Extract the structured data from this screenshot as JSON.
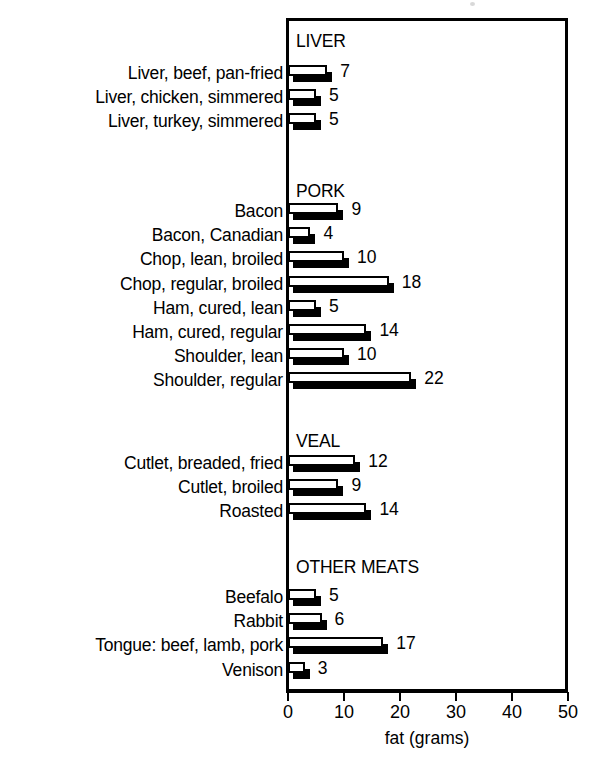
{
  "chart_data": {
    "type": "bar",
    "orientation": "horizontal",
    "title": "",
    "xlabel": "fat (grams)",
    "ylabel": "",
    "xlim": [
      0,
      50
    ],
    "xticks": [
      0,
      10,
      20,
      30,
      40,
      50
    ],
    "grid": false,
    "legend": "none",
    "units": "grams",
    "groups": [
      {
        "name": "LIVER",
        "categories": [
          "Liver, beef, pan-fried",
          "Liver, chicken, simmered",
          "Liver, turkey, simmered"
        ],
        "values": [
          7,
          5,
          5
        ]
      },
      {
        "name": "PORK",
        "categories": [
          "Bacon",
          "Bacon, Canadian",
          "Chop, lean, broiled",
          "Chop, regular, broiled",
          "Ham, cured, lean",
          "Ham, cured, regular",
          "Shoulder, lean",
          "Shoulder, regular"
        ],
        "values": [
          9,
          4,
          10,
          18,
          5,
          14,
          10,
          22
        ]
      },
      {
        "name": "VEAL",
        "categories": [
          "Cutlet, breaded, fried",
          "Cutlet, broiled",
          "Roasted"
        ],
        "values": [
          12,
          9,
          14
        ]
      },
      {
        "name": "OTHER MEATS",
        "categories": [
          "Beefalo",
          "Rabbit",
          "Tongue: beef, lamb, pork",
          "Venison"
        ],
        "values": [
          5,
          6,
          17,
          3
        ]
      }
    ],
    "categories": [
      "Liver, beef, pan-fried",
      "Liver, chicken, simmered",
      "Liver, turkey, simmered",
      "Bacon",
      "Bacon, Canadian",
      "Chop, lean, broiled",
      "Chop, regular, broiled",
      "Ham, cured, lean",
      "Ham, cured, regular",
      "Shoulder, lean",
      "Shoulder, regular",
      "Cutlet, breaded, fried",
      "Cutlet, broiled",
      "Roasted",
      "Beefalo",
      "Rabbit",
      "Tongue: beef, lamb, pork",
      "Venison"
    ],
    "values": [
      7,
      5,
      5,
      9,
      4,
      10,
      18,
      5,
      14,
      10,
      22,
      12,
      9,
      14,
      5,
      6,
      17,
      3
    ],
    "colors": {
      "bar_face": "#ffffff",
      "bar_outline": "#000000",
      "bar_shadow": "#000000",
      "text": "#000000",
      "frame": "#000000",
      "background": "#ffffff"
    }
  }
}
